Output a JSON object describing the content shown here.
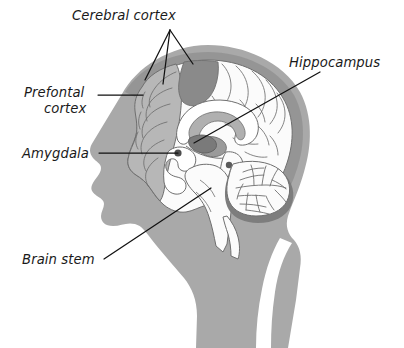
{
  "figure": {
    "background_color": "#ffffff"
  },
  "colors": {
    "head_silhouette": "#a9a9a9",
    "skull_band": "#8f8f8f",
    "frontal_cortex_fill": "#b7b7b7",
    "dark_cortex_patch": "#8a8a8a",
    "brain_white": "#fbfbfb",
    "cerebellum_rim": "#7d7d7d",
    "structure_outline": "#6f6f6f",
    "leader_line": "#111111",
    "label_text": "#1a1a1a",
    "ventricle_gray": "#b0b0b0",
    "amygdala_dot": "#4d4d4d"
  },
  "labels": [
    {
      "id": "cerebral-cortex",
      "text": "Cerebral cortex",
      "text_x": 72,
      "text_y": 20,
      "anchor": "start",
      "pointer_origin": {
        "x": 170,
        "y": 30
      },
      "pointer_targets": [
        {
          "x": 145,
          "y": 80
        },
        {
          "x": 163,
          "y": 84
        },
        {
          "x": 193,
          "y": 64
        }
      ]
    },
    {
      "id": "prefontal-cortex",
      "text_line_1": "Prefontal",
      "text_line_2": "cortex",
      "line1_x": 24,
      "line1_y": 97,
      "line2_x": 44,
      "line2_y": 113,
      "anchor": "start",
      "leader": {
        "x1": 98,
        "y1": 95,
        "x2": 143,
        "y2": 95
      }
    },
    {
      "id": "amygdala",
      "text": "Amygdala",
      "text_x": 22,
      "text_y": 158,
      "anchor": "start",
      "leader": {
        "x1": 99,
        "y1": 153,
        "x2": 178,
        "y2": 153
      }
    },
    {
      "id": "hippocampus",
      "text": "Hippocampus",
      "text_x": 289,
      "text_y": 67,
      "anchor": "start",
      "leader": {
        "x1": 320,
        "y1": 72,
        "x2": 194,
        "y2": 143
      }
    },
    {
      "id": "brain-stem",
      "text": "Brain stem",
      "text_x": 22,
      "text_y": 264,
      "anchor": "start",
      "leader": {
        "x1": 104,
        "y1": 259,
        "x2": 211,
        "y2": 188
      }
    }
  ],
  "structures": [
    {
      "id": "cerebral-cortex",
      "name": "Cerebral cortex"
    },
    {
      "id": "prefontal-cortex",
      "name": "Prefontal cortex"
    },
    {
      "id": "amygdala",
      "name": "Amygdala"
    },
    {
      "id": "hippocampus",
      "name": "Hippocampus"
    },
    {
      "id": "brain-stem",
      "name": "Brain stem"
    },
    {
      "id": "cerebellum",
      "name": "Cerebellum"
    },
    {
      "id": "corpus-callosum",
      "name": "Corpus callosum"
    }
  ]
}
